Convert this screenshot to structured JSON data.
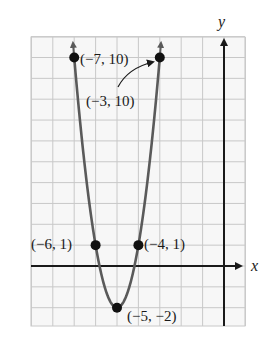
{
  "chart_data": {
    "type": "line",
    "title": "",
    "function": "y = 3(x + 5)^2 - 2",
    "xlabel": "x",
    "ylabel": "y",
    "xlim": [
      -9,
      1
    ],
    "ylim": [
      -3,
      11
    ],
    "grid": true,
    "grid_step": 1,
    "tick_labels": false,
    "points": [
      {
        "x": -7,
        "y": 10,
        "label": "(−7, 10)"
      },
      {
        "x": -3,
        "y": 10,
        "label": "(−3, 10)"
      },
      {
        "x": -6,
        "y": 1,
        "label": "(−6, 1)"
      },
      {
        "x": -4,
        "y": 1,
        "label": "(−4, 1)"
      },
      {
        "x": -5,
        "y": -2,
        "label": "(−5, −2)"
      }
    ],
    "annotations": [
      {
        "text": "(−3, 10)",
        "arrow_to": {
          "x": -3,
          "y": 10
        }
      }
    ],
    "curve_color": "#5a5a5a",
    "grid_color": "#c8c8c8",
    "axis_color": "#1a1a1a"
  },
  "labels": {
    "x_axis": "x",
    "y_axis": "y",
    "p1": "(−7, 10)",
    "p2": "(−3, 10)",
    "p3": "(−6, 1)",
    "p4": "(−4, 1)",
    "p5": "(−5, −2)"
  }
}
